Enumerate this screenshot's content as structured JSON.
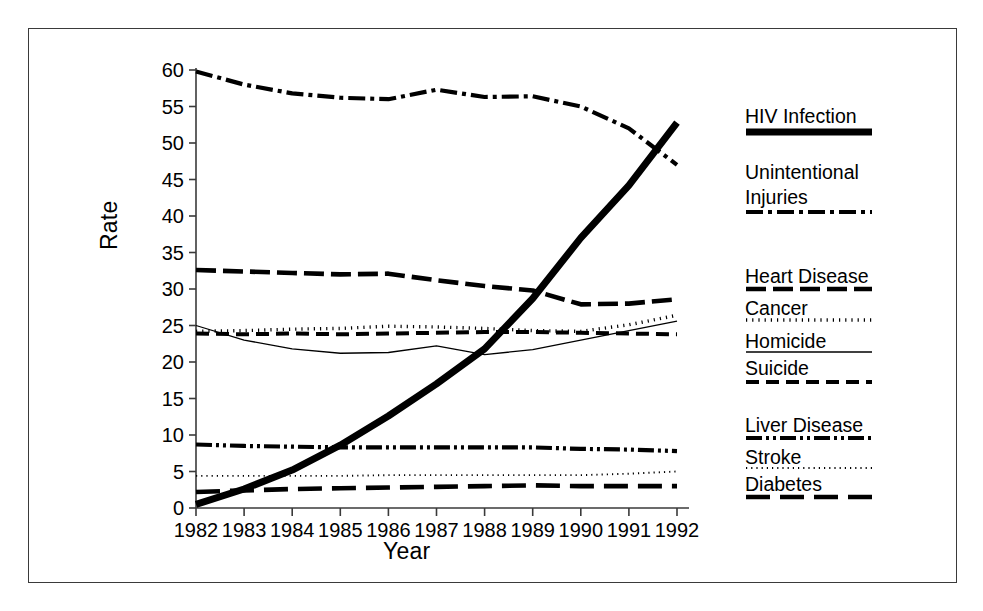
{
  "chart_data": {
    "type": "line",
    "title": "",
    "xlabel": "Year",
    "ylabel": "Rate",
    "x": [
      1982,
      1983,
      1984,
      1985,
      1986,
      1987,
      1988,
      1989,
      1990,
      1991,
      1992
    ],
    "xticklabels": [
      "1982",
      "1983",
      "1984",
      "1985",
      "1986",
      "1987",
      "1988",
      "1989",
      "1990",
      "1991",
      "1992"
    ],
    "yticklabels": [
      "0",
      "5",
      "10",
      "15",
      "20",
      "25",
      "30",
      "35",
      "40",
      "45",
      "50",
      "55",
      "60"
    ],
    "ylim": [
      0,
      60
    ],
    "ytick_step": 5,
    "xlim": [
      1982,
      1992
    ],
    "grid": false,
    "legend_position": "right",
    "series": [
      {
        "name": "HIV Infection",
        "style": "thick-solid",
        "values": [
          0.5,
          2.6,
          5.2,
          8.6,
          12.6,
          17.0,
          21.8,
          28.7,
          37.0,
          44.2,
          52.8
        ]
      },
      {
        "name": "Unintentional Injuries",
        "style": "dash-dot",
        "values": [
          59.8,
          58.0,
          56.8,
          56.2,
          56.0,
          57.3,
          56.3,
          56.4,
          55.0,
          52.0,
          47.0
        ]
      },
      {
        "name": "Heart Disease",
        "style": "dash-long",
        "values": [
          32.6,
          32.4,
          32.2,
          32.0,
          32.1,
          31.2,
          30.4,
          29.8,
          27.9,
          28.0,
          28.6
        ]
      },
      {
        "name": "Cancer",
        "style": "dotted",
        "values": [
          24.2,
          24.3,
          24.5,
          24.6,
          24.9,
          24.8,
          24.6,
          24.3,
          24.2,
          25.1,
          26.4
        ]
      },
      {
        "name": "Homicide",
        "style": "thin-solid",
        "values": [
          25.0,
          23.0,
          21.8,
          21.2,
          21.3,
          22.2,
          21.0,
          21.7,
          23.0,
          24.3,
          25.6
        ]
      },
      {
        "name": "Suicide",
        "style": "dash-medium",
        "values": [
          23.9,
          23.8,
          23.9,
          23.8,
          23.9,
          24.0,
          24.1,
          24.1,
          24.0,
          23.9,
          23.8
        ]
      },
      {
        "name": "Liver Disease",
        "style": "dash-dot-dot",
        "values": [
          8.7,
          8.5,
          8.4,
          8.3,
          8.3,
          8.3,
          8.3,
          8.3,
          8.1,
          8.0,
          7.8
        ]
      },
      {
        "name": "Stroke",
        "style": "fine-dotted",
        "values": [
          4.4,
          4.4,
          4.4,
          4.4,
          4.5,
          4.5,
          4.5,
          4.5,
          4.5,
          4.7,
          5.0
        ]
      },
      {
        "name": "Diabetes",
        "style": "dash-xlong",
        "values": [
          2.2,
          2.4,
          2.6,
          2.7,
          2.8,
          2.9,
          3.0,
          3.1,
          3.0,
          3.0,
          3.0
        ]
      }
    ]
  },
  "legend": {
    "entries": [
      {
        "label": "HIV Infection",
        "style": "thick-solid"
      },
      {
        "label": "Unintentional",
        "label2": "Injuries",
        "style": "dash-dot"
      },
      {
        "label": "Heart Disease",
        "style": "dash-long"
      },
      {
        "label": "Cancer",
        "style": "dotted"
      },
      {
        "label": "Homicide",
        "style": "thin-solid"
      },
      {
        "label": "Suicide",
        "style": "dash-medium"
      },
      {
        "label": "Liver Disease",
        "style": "dash-dot-dot"
      },
      {
        "label": "Stroke",
        "style": "fine-dotted"
      },
      {
        "label": "Diabetes",
        "style": "dash-xlong"
      }
    ]
  },
  "colors": {
    "line": "#000000",
    "axis": "#3a3a3a",
    "frame": "#3a3a3a",
    "background": "#ffffff"
  }
}
